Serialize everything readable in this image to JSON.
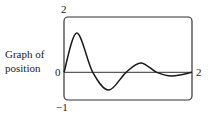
{
  "chart_data": {
    "type": "line",
    "title": "",
    "ylabel": "Graph of position",
    "xlabel": "",
    "xlim": [
      0,
      2
    ],
    "ylim": [
      -1,
      2
    ],
    "grid": false,
    "legend": null,
    "tick_labels": {
      "y_top": "2",
      "y_zero": "0",
      "y_bottom": "−1",
      "x_right": "2"
    },
    "series": [
      {
        "name": "position",
        "x": [
          0,
          0.2,
          0.45,
          0.7,
          0.97,
          1.2,
          1.45,
          1.69,
          2.0
        ],
        "values": [
          0,
          1.42,
          0,
          -0.64,
          0,
          0.34,
          0,
          -0.13,
          0
        ]
      }
    ],
    "annotations": [
      "horizontal zero line across plot"
    ]
  },
  "labels": {
    "side_line1": "Graph of",
    "side_line2": "position"
  }
}
